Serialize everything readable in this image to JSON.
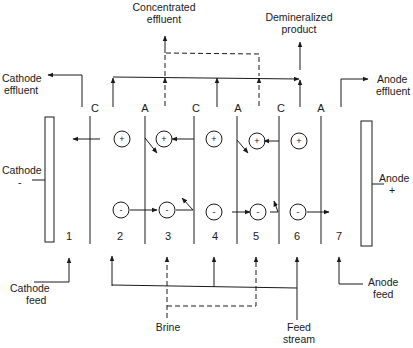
{
  "labels": {
    "concentrated_effluent": [
      "Concentrated",
      "effluent"
    ],
    "demineralized_product": [
      "Demineralized",
      "product"
    ],
    "cathode_effluent": [
      "Cathode",
      "effluent"
    ],
    "anode_effluent": [
      "Anode",
      "effluent"
    ],
    "cathode": "Cathode",
    "cathode_sign": "-",
    "anode": "Anode",
    "anode_sign": "+",
    "cathode_feed": [
      "Cathode",
      "feed"
    ],
    "anode_feed": [
      "Anode",
      "feed"
    ],
    "brine": "Brine",
    "feed_stream": [
      "Feed",
      "stream"
    ]
  },
  "membranes": [
    {
      "type": "C",
      "x": 90
    },
    {
      "type": "A",
      "x": 145
    },
    {
      "type": "C",
      "x": 194
    },
    {
      "type": "A",
      "x": 237
    },
    {
      "type": "C",
      "x": 279
    },
    {
      "type": "A",
      "x": 321
    }
  ],
  "compartments": [
    "1",
    "2",
    "3",
    "4",
    "5",
    "6",
    "7"
  ],
  "ions": {
    "cation_sign": "+",
    "anion_sign": "-"
  },
  "colors": {
    "line": "#1a1a1a",
    "background": "#ffffff"
  }
}
